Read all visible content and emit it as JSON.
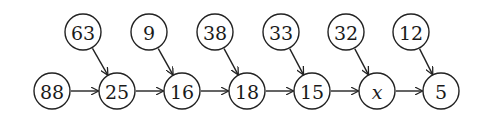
{
  "diagram": {
    "type": "directed-graph",
    "radius": 18,
    "nodes": [
      {
        "id": "b0",
        "label": "88",
        "x": 52,
        "y": 91
      },
      {
        "id": "b1",
        "label": "25",
        "x": 117,
        "y": 91
      },
      {
        "id": "b2",
        "label": "16",
        "x": 182,
        "y": 91
      },
      {
        "id": "b3",
        "label": "18",
        "x": 247,
        "y": 91
      },
      {
        "id": "b4",
        "label": "15",
        "x": 312,
        "y": 91
      },
      {
        "id": "b5",
        "label": "x",
        "x": 377,
        "y": 91,
        "italic": true
      },
      {
        "id": "b6",
        "label": "5",
        "x": 441,
        "y": 91
      },
      {
        "id": "t1",
        "label": "63",
        "x": 83,
        "y": 32
      },
      {
        "id": "t2",
        "label": "9",
        "x": 149,
        "y": 32
      },
      {
        "id": "t3",
        "label": "38",
        "x": 215,
        "y": 32
      },
      {
        "id": "t4",
        "label": "33",
        "x": 281,
        "y": 32
      },
      {
        "id": "t5",
        "label": "32",
        "x": 346,
        "y": 32
      },
      {
        "id": "t6",
        "label": "12",
        "x": 411,
        "y": 32
      }
    ],
    "edges": [
      {
        "from": "b0",
        "to": "b1"
      },
      {
        "from": "b1",
        "to": "b2"
      },
      {
        "from": "b2",
        "to": "b3"
      },
      {
        "from": "b3",
        "to": "b4"
      },
      {
        "from": "b4",
        "to": "b5"
      },
      {
        "from": "b5",
        "to": "b6"
      },
      {
        "from": "t1",
        "to": "b1"
      },
      {
        "from": "t2",
        "to": "b2"
      },
      {
        "from": "t3",
        "to": "b3"
      },
      {
        "from": "t4",
        "to": "b4"
      },
      {
        "from": "t5",
        "to": "b5"
      },
      {
        "from": "t6",
        "to": "b6"
      }
    ]
  }
}
